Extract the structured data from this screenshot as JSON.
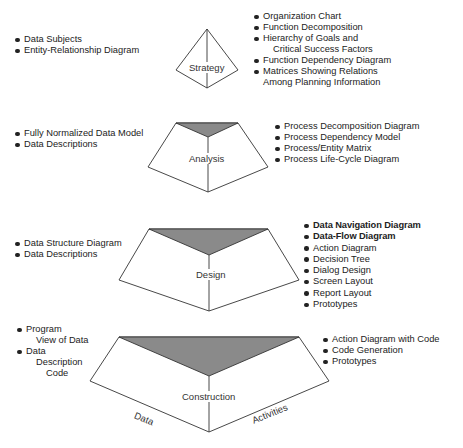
{
  "colors": {
    "line": "#333333",
    "fill_shaded": "#8a8a8a",
    "fill_face": "#ffffff"
  },
  "stages": [
    {
      "name": "Strategy",
      "data_items": [
        "Data Subjects",
        "Entity-Relationship Diagram"
      ],
      "activity_items": [
        "Organization Chart",
        "Function Decomposition",
        {
          "first": "Hierarchy of Goals and",
          "cont": "Critical Success Factors"
        },
        "Function Dependency Diagram",
        {
          "first": "Matrices Showing Relations",
          "cont": "Among Planning Information"
        }
      ]
    },
    {
      "name": "Analysis",
      "data_items": [
        "Fully Normalized Data Model",
        "Data Descriptions"
      ],
      "activity_items": [
        "Process Decomposition Diagram",
        "Process Dependency Model",
        "Process/Entity Matrix",
        "Process Life-Cycle Diagram"
      ]
    },
    {
      "name": "Design",
      "data_items": [
        "Data Structure Diagram",
        "Data Descriptions"
      ],
      "activity_items": [
        "Data Navigation Diagram",
        "Data-Flow Diagram",
        "Action Diagram",
        "Decision Tree",
        "Dialog Design",
        "Screen Layout",
        "Report Layout",
        "Prototypes"
      ]
    },
    {
      "name": "Construction",
      "data_items": [
        {
          "first": "Program",
          "cont": "View of Data"
        },
        {
          "first": "Data",
          "cont": "Description",
          "cont2": "Code"
        }
      ],
      "activity_items": [
        "Action Diagram with Code",
        "Code Generation",
        "Prototypes"
      ]
    }
  ],
  "axes": {
    "left": "Data",
    "right": "Activities"
  }
}
